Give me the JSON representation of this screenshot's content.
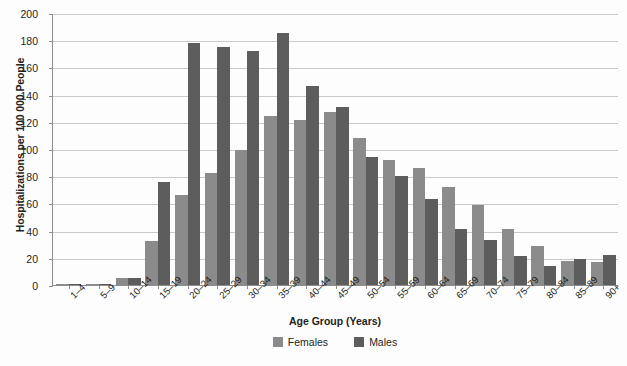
{
  "chart_data": {
    "type": "bar",
    "title": "",
    "xlabel": "Age Group (Years)",
    "ylabel": "Hospitalizations per 100 000 People",
    "ylim": [
      0,
      200
    ],
    "ytick_step": 20,
    "yticks": [
      200,
      180,
      160,
      140,
      120,
      100,
      80,
      60,
      40,
      20,
      0
    ],
    "grid": true,
    "legend_position": "bottom-center",
    "categories": [
      "1–4",
      "5–9",
      "10–14",
      "15–19",
      "20–24",
      "25–29",
      "30–34",
      "35–39",
      "40–44",
      "45–49",
      "50–54",
      "55–59",
      "60–64",
      "65–69",
      "70–74",
      "75–79",
      "80–84",
      "85–89",
      "90+"
    ],
    "series": [
      {
        "name": "Females",
        "color": "#8b8b8b",
        "values": [
          0.5,
          1,
          5,
          32,
          66,
          82,
          99,
          124,
          121,
          127,
          108,
          92,
          86,
          72,
          59,
          41,
          29,
          18,
          17
        ]
      },
      {
        "name": "Males",
        "color": "#5d5d5d",
        "values": [
          0.5,
          1,
          5,
          76,
          178,
          175,
          172,
          185,
          146,
          131,
          94,
          80,
          63,
          41,
          33,
          21,
          14,
          19,
          22
        ]
      }
    ]
  },
  "legend": {
    "items": [
      {
        "label": "Females",
        "swatch": "female-swatch"
      },
      {
        "label": "Males",
        "swatch": "male-swatch"
      }
    ]
  }
}
